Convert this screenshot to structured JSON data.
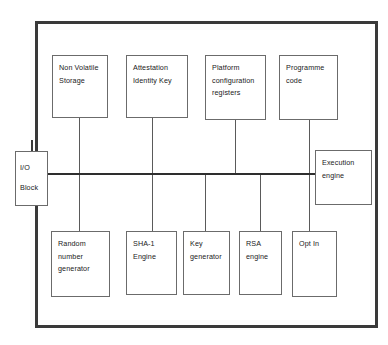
{
  "diagram": {
    "frame_name": "tpm-chip-boundary",
    "colors": {
      "frame": "#3a3a3a",
      "box_border": "#6b6b6b",
      "bus": "#2e2e2e",
      "connector": "#5a5a5a",
      "text": "#1a1a1a",
      "background": "#ffffff"
    },
    "io": {
      "name": "io-block",
      "lines": [
        "I/O",
        "Block"
      ]
    },
    "top_boxes": [
      {
        "name": "non-volatile-storage",
        "lines": [
          "Non Volatile",
          "Storage"
        ]
      },
      {
        "name": "attestation-identity-key",
        "lines": [
          "Attestation",
          "Identity Key"
        ]
      },
      {
        "name": "platform-configuration-registers",
        "lines": [
          "Platform",
          "configuration",
          "registers"
        ]
      },
      {
        "name": "programme-code",
        "lines": [
          "Programme",
          "code"
        ]
      }
    ],
    "side_box": {
      "name": "execution-engine",
      "lines": [
        "Execution",
        "engine"
      ]
    },
    "bottom_boxes": [
      {
        "name": "random-number-generator",
        "lines": [
          "Random",
          "number",
          "generator"
        ]
      },
      {
        "name": "sha-1-engine",
        "lines": [
          "SHA-1",
          "Engine"
        ]
      },
      {
        "name": "key-generator",
        "lines": [
          "Key",
          "generator"
        ]
      },
      {
        "name": "rsa-engine",
        "lines": [
          "RSA",
          "engine"
        ]
      },
      {
        "name": "opt-in",
        "lines": [
          "Opt In"
        ]
      }
    ]
  }
}
